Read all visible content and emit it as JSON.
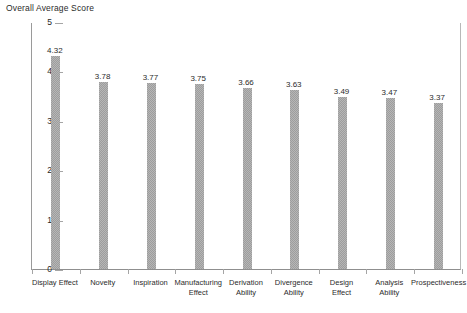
{
  "chart_data": {
    "type": "bar",
    "title": "Overall Average Score",
    "xlabel": "",
    "ylabel": "",
    "ylim": [
      0,
      5
    ],
    "yticks": [
      "0",
      "1",
      "2",
      "3",
      "4",
      "5"
    ],
    "grid": false,
    "legend": null,
    "bar_color": "#9d9d9d",
    "categories": [
      "Display Effect",
      "Novelty",
      "Inspiration",
      "Manufacturing\nEffect",
      "Derivation\nAbility",
      "Divergence\nAbility",
      "Design\nEffect",
      "Analysis\nAbility",
      "Prospectiveness"
    ],
    "values": [
      4.32,
      3.78,
      3.77,
      3.75,
      3.66,
      3.63,
      3.49,
      3.47,
      3.37
    ],
    "value_labels": [
      "4.32",
      "3.78",
      "3.77",
      "3.75",
      "3.66",
      "3.63",
      "3.49",
      "3.47",
      "3.37"
    ]
  }
}
